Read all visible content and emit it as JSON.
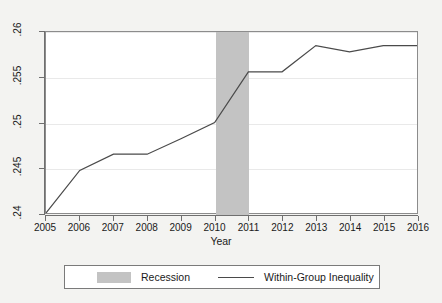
{
  "chart_data": {
    "type": "line",
    "title": "",
    "subtitle": "",
    "xlabel": "Year",
    "ylabel": "",
    "x": [
      2005,
      2006,
      2007,
      2008,
      2009,
      2010,
      2011,
      2012,
      2013,
      2014,
      2015,
      2016
    ],
    "xtick_labels": [
      "2005",
      "2006",
      "2007",
      "2008",
      "2009",
      "2010",
      "2011",
      "2012",
      "2013",
      "2014",
      "2015",
      "2016"
    ],
    "xlim": [
      2005,
      2016
    ],
    "ylim": [
      0.24,
      0.26
    ],
    "ytick_values": [
      0.24,
      0.245,
      0.25,
      0.255,
      0.26
    ],
    "ytick_labels": [
      ".24",
      ".245",
      ".25",
      ".255",
      ".26"
    ],
    "grid": "horizontal",
    "legend_position": "bottom",
    "series": [
      {
        "name": "Within-Group Inequality",
        "kind": "line",
        "color": "#4a4a4a",
        "values": [
          0.24,
          0.2447,
          0.2465,
          0.2465,
          0.2482,
          0.25,
          0.2556,
          0.2556,
          0.2585,
          0.2578,
          0.2585,
          0.2585
        ]
      }
    ],
    "shaded_regions": [
      {
        "name": "Recession",
        "x_start": 2010,
        "x_end": 2011,
        "color": "#c3c3c3"
      }
    ],
    "legend_entries": [
      {
        "label": "Recession",
        "marker": "swatch",
        "color": "#c3c3c3"
      },
      {
        "label": "Within-Group Inequality",
        "marker": "line",
        "color": "#4a4a4a"
      }
    ]
  },
  "colors": {
    "background": "#f3f3f1",
    "plot_background": "#ffffff",
    "axis": "#6f6f6f",
    "gridline": "#e9e9e9",
    "series_line": "#4a4a4a",
    "recession_fill": "#c3c3c3",
    "text": "#1a1a1a"
  }
}
